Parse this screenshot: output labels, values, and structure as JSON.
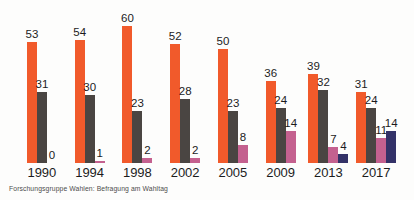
{
  "caption": "Forschungsgruppe Wahlen: Befragung am Wahltag",
  "colors": {
    "background": "#fdfdfc",
    "label_text": "#1c1c1c",
    "caption_text": "#4d4d4d"
  },
  "chart_data": {
    "type": "bar",
    "title": "",
    "xlabel": "",
    "ylabel": "",
    "ylim": [
      0,
      60
    ],
    "grid": false,
    "legend_position": "none",
    "value_labels": true,
    "categories": [
      "1990",
      "1994",
      "1998",
      "2002",
      "2005",
      "2009",
      "2013",
      "2017"
    ],
    "series": [
      {
        "name": "series-orange",
        "color": "#f15a2b",
        "values": [
          53,
          54,
          60,
          52,
          50,
          36,
          39,
          31
        ]
      },
      {
        "name": "series-darkgray",
        "color": "#4a4542",
        "values": [
          31,
          30,
          23,
          28,
          23,
          24,
          32,
          24
        ]
      },
      {
        "name": "series-pink",
        "color": "#c4618f",
        "values": [
          0,
          1,
          2,
          2,
          8,
          14,
          7,
          11
        ]
      },
      {
        "name": "series-navy",
        "color": "#333268",
        "values": [
          null,
          null,
          null,
          null,
          null,
          null,
          4,
          14
        ]
      }
    ],
    "source": "Forschungsgruppe Wahlen: Befragung am Wahltag"
  }
}
